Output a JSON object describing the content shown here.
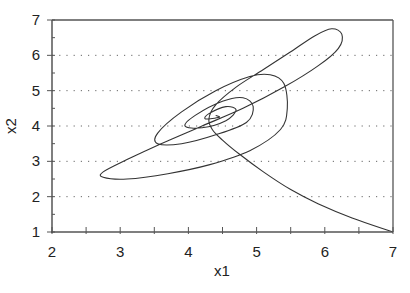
{
  "chart_data": {
    "type": "line",
    "title": "",
    "xlabel": "x1",
    "ylabel": "x2",
    "xlim": [
      2,
      7
    ],
    "ylim": [
      1,
      7
    ],
    "xticks": [
      2,
      3,
      4,
      5,
      6,
      7
    ],
    "yticks": [
      1,
      2,
      3,
      4,
      5,
      6,
      7
    ],
    "grid": {
      "horizontal": true,
      "vertical": false,
      "style": "dotted"
    },
    "legend": null,
    "series": [
      {
        "name": "trajectory",
        "description": "Phase-plane trajectory starting at (7,1) spiraling inward to equilibrium near (4.4,4.3)",
        "points": [
          [
            7.0,
            1.0
          ],
          [
            6.4,
            1.4
          ],
          [
            5.9,
            1.8
          ],
          [
            5.5,
            2.2
          ],
          [
            5.1,
            2.7
          ],
          [
            4.75,
            3.2
          ],
          [
            4.5,
            3.6
          ],
          [
            4.35,
            3.9
          ],
          [
            4.3,
            4.2
          ],
          [
            4.4,
            4.6
          ],
          [
            4.7,
            5.1
          ],
          [
            5.1,
            5.6
          ],
          [
            5.5,
            6.1
          ],
          [
            5.85,
            6.55
          ],
          [
            6.1,
            6.75
          ],
          [
            6.25,
            6.6
          ],
          [
            6.2,
            6.2
          ],
          [
            5.9,
            5.7
          ],
          [
            5.4,
            5.1
          ],
          [
            4.8,
            4.5
          ],
          [
            4.2,
            4.0
          ],
          [
            3.6,
            3.5
          ],
          [
            3.1,
            3.05
          ],
          [
            2.75,
            2.7
          ],
          [
            2.75,
            2.55
          ],
          [
            3.1,
            2.5
          ],
          [
            3.7,
            2.65
          ],
          [
            4.3,
            2.9
          ],
          [
            4.9,
            3.3
          ],
          [
            5.35,
            3.9
          ],
          [
            5.45,
            4.5
          ],
          [
            5.4,
            5.2
          ],
          [
            5.2,
            5.45
          ],
          [
            4.9,
            5.4
          ],
          [
            4.4,
            5.0
          ],
          [
            3.9,
            4.4
          ],
          [
            3.55,
            3.8
          ],
          [
            3.55,
            3.5
          ],
          [
            3.9,
            3.5
          ],
          [
            4.4,
            3.75
          ],
          [
            4.85,
            4.1
          ],
          [
            4.95,
            4.55
          ],
          [
            4.8,
            4.8
          ],
          [
            4.5,
            4.7
          ],
          [
            4.1,
            4.3
          ],
          [
            3.95,
            4.0
          ],
          [
            4.2,
            3.95
          ],
          [
            4.55,
            4.15
          ],
          [
            4.7,
            4.45
          ],
          [
            4.55,
            4.55
          ],
          [
            4.3,
            4.35
          ],
          [
            4.25,
            4.2
          ],
          [
            4.45,
            4.25
          ],
          [
            4.4,
            4.3
          ]
        ]
      }
    ],
    "equilibrium_approx": [
      4.4,
      4.3
    ]
  },
  "axes": {
    "x_title": "x1",
    "y_title": "x2",
    "x_tick_labels": [
      "2",
      "3",
      "4",
      "5",
      "6",
      "7"
    ],
    "y_tick_labels": [
      "1",
      "2",
      "3",
      "4",
      "5",
      "6",
      "7"
    ]
  },
  "style": {
    "line_color": "#333333",
    "axis_color": "#555555",
    "grid_color": "#666666"
  }
}
